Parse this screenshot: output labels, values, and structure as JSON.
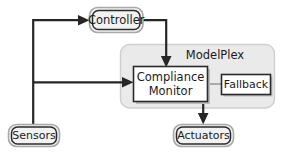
{
  "diagram": {
    "group": {
      "name": "modelplex-group",
      "label": "ModelPlex",
      "fill": "#eaeaea",
      "stroke": "#cfcfcf"
    },
    "nodes": [
      {
        "id": "controller",
        "label": "Controller",
        "shape": "rounded-rect",
        "fill": "#f2f2f2",
        "stroke": "#2b2b2b"
      },
      {
        "id": "sensors",
        "label": "Sensors",
        "shape": "rounded-rect",
        "fill": "#f2f2f2",
        "stroke": "#2b2b2b"
      },
      {
        "id": "actuators",
        "label": "Actuators",
        "shape": "rounded-rect",
        "fill": "#f2f2f2",
        "stroke": "#2b2b2b"
      },
      {
        "id": "compliance-monitor",
        "label_line1": "Compliance",
        "label_line2": "Monitor",
        "shape": "rect",
        "fill": "#ffffff",
        "stroke": "#2b2b2b"
      },
      {
        "id": "fallback",
        "label": "Fallback",
        "shape": "rect",
        "fill": "#ffffff",
        "stroke": "#2b2b2b"
      }
    ],
    "edges": [
      {
        "id": "sensors-to-controller",
        "from": "sensors",
        "to": "controller",
        "arrow": true
      },
      {
        "id": "sensors-to-compliance-monitor",
        "from": "sensors",
        "to": "compliance-monitor",
        "arrow": true
      },
      {
        "id": "controller-to-compliance-monitor",
        "from": "controller",
        "to": "compliance-monitor",
        "arrow": true
      },
      {
        "id": "compliance-monitor-to-actuators",
        "from": "compliance-monitor",
        "to": "actuators",
        "arrow": true
      },
      {
        "id": "compliance-monitor-to-fallback",
        "from": "compliance-monitor",
        "to": "fallback",
        "arrow": false
      }
    ],
    "colors": {
      "edge": "#262626",
      "edge_light": "#9a9a9a",
      "node_fill": "#f2f2f2",
      "group_fill": "#eaeaea",
      "text": "#1b1b1b"
    }
  }
}
